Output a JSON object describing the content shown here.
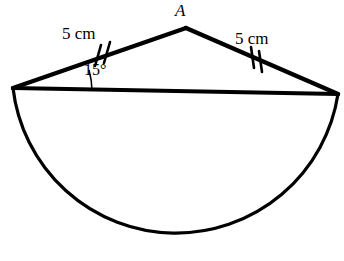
{
  "figure": {
    "type": "geometry-diagram",
    "background_color": "#ffffff",
    "stroke_color": "#000000",
    "labels": {
      "apex": "A",
      "left_side": "5 cm",
      "right_side": "5 cm",
      "angle": "15°"
    },
    "geometry": {
      "apex_point": [
        186,
        28
      ],
      "left_vertex": [
        13,
        88
      ],
      "right_vertex": [
        338,
        94
      ],
      "semicircle_center": [
        175.5,
        91
      ],
      "semicircle_radius": 164,
      "semicircle_bottom_y": 255,
      "angle_arc_degrees": 15,
      "tick_marks_per_side": 2,
      "chord_stroke_width": 4,
      "arc_stroke_width": 3
    }
  }
}
